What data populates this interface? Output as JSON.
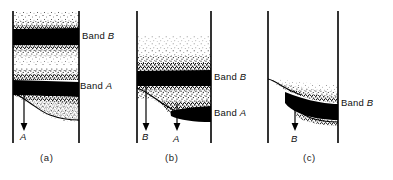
{
  "figure": {
    "type": "scientific-illustration",
    "background_color": "#ffffff",
    "ink_color": "#000000"
  },
  "panels": [
    {
      "id": "a",
      "caption": "(a)",
      "bands": [
        {
          "name": "Band B",
          "label_prefix": "Band",
          "label_letter": "B"
        },
        {
          "name": "Band A",
          "label_prefix": "Band",
          "label_letter": "A"
        }
      ],
      "arrows": [
        {
          "letter": "A",
          "direction": "down"
        }
      ]
    },
    {
      "id": "b",
      "caption": "(b)",
      "bands": [
        {
          "name": "Band B",
          "label_prefix": "Band",
          "label_letter": "B"
        },
        {
          "name": "Band A",
          "label_prefix": "Band",
          "label_letter": "A"
        }
      ],
      "arrows": [
        {
          "letter": "B",
          "direction": "down"
        },
        {
          "letter": "A",
          "direction": "down"
        }
      ]
    },
    {
      "id": "c",
      "caption": "(c)",
      "bands": [
        {
          "name": "Band B",
          "label_prefix": "Band",
          "label_letter": "B"
        }
      ],
      "arrows": [
        {
          "letter": "B",
          "direction": "down"
        }
      ]
    }
  ],
  "labels": {
    "panel_a_band_b": "Band",
    "panel_a_band_b_letter": "B",
    "panel_a_band_a": "Band",
    "panel_a_band_a_letter": "A",
    "panel_a_arrow_a": "A",
    "panel_a_caption": "(a)",
    "panel_b_band_b": "Band",
    "panel_b_band_b_letter": "B",
    "panel_b_band_a": "Band",
    "panel_b_band_a_letter": "A",
    "panel_b_arrow_b": "B",
    "panel_b_arrow_a": "A",
    "panel_b_caption": "(b)",
    "panel_c_band_b": "Band",
    "panel_c_band_b_letter": "B",
    "panel_c_arrow_b": "B",
    "panel_c_caption": "(c)"
  }
}
